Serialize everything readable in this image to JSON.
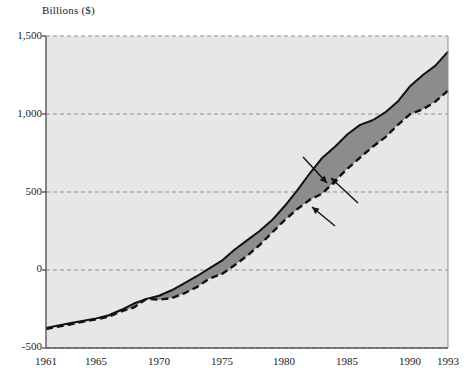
{
  "figure": {
    "axis_label_top": "Billions ($)",
    "plot_bg_color": "#e7e7e7",
    "band_color": "#8c8c8c",
    "line_color": "#111111",
    "grid_color": "#8f8f8f",
    "axis_color": "#555555"
  },
  "annotations": {
    "expenditures": "Expenditures",
    "deficit": "Deficit",
    "receipts": "Receipts"
  },
  "yticks": {
    "t0": "1,500",
    "t1": "1,000",
    "t2": "500",
    "t3": "0",
    "t4": "-500"
  },
  "xticks": {
    "t0": "1961",
    "t1": "1965",
    "t2": "1970",
    "t3": "1975",
    "t4": "1980",
    "t5": "1985",
    "t6": "1990",
    "t7": "1993"
  },
  "chart_data": {
    "type": "area",
    "title": "",
    "xlabel": "",
    "ylabel": "Billions ($)",
    "xlim": [
      1961,
      1993
    ],
    "ylim": [
      -500,
      1500
    ],
    "ytick_values": [
      -500,
      0,
      500,
      1000,
      1500
    ],
    "xtick_values": [
      1961,
      1965,
      1970,
      1975,
      1980,
      1985,
      1990,
      1993
    ],
    "grid": "horizontal-dashed",
    "legend": "none (inline annotations with arrows)",
    "annotations": [
      {
        "text": "Expenditures",
        "points_to_series": "Expenditures",
        "near_year": 1983
      },
      {
        "text": "Deficit",
        "points_to_series": "shaded band between curves",
        "near_year": 1985
      },
      {
        "text": "Receipts",
        "points_to_series": "Receipts",
        "near_year": 1981
      }
    ],
    "x": [
      1961,
      1962,
      1963,
      1964,
      1965,
      1966,
      1967,
      1968,
      1969,
      1970,
      1971,
      1972,
      1973,
      1974,
      1975,
      1976,
      1977,
      1978,
      1979,
      1980,
      1981,
      1982,
      1983,
      1984,
      1985,
      1986,
      1987,
      1988,
      1989,
      1990,
      1991,
      1992,
      1993
    ],
    "series": [
      {
        "name": "Expenditures",
        "style": "solid-upper-boundary-of-shaded-band",
        "values": [
          -372,
          -355,
          -340,
          -325,
          -310,
          -290,
          -255,
          -215,
          -185,
          -165,
          -130,
          -85,
          -40,
          10,
          60,
          130,
          190,
          250,
          320,
          410,
          510,
          620,
          720,
          790,
          870,
          930,
          960,
          1010,
          1080,
          1180,
          1250,
          1310,
          1400
        ]
      },
      {
        "name": "Receipts",
        "style": "dashed-lower-boundary-of-shaded-band",
        "values": [
          -378,
          -362,
          -348,
          -330,
          -316,
          -300,
          -265,
          -240,
          -185,
          -190,
          -180,
          -150,
          -110,
          -55,
          -25,
          30,
          90,
          160,
          240,
          320,
          390,
          450,
          490,
          570,
          650,
          720,
          790,
          850,
          930,
          1000,
          1030,
          1080,
          1150
        ]
      },
      {
        "name": "Deficit",
        "style": "shaded-area-between-Expenditures-and-Receipts",
        "values": [
          6,
          7,
          8,
          5,
          6,
          10,
          10,
          25,
          0,
          25,
          50,
          65,
          70,
          65,
          85,
          100,
          100,
          90,
          80,
          90,
          120,
          170,
          230,
          220,
          220,
          210,
          170,
          160,
          150,
          180,
          220,
          230,
          250
        ]
      }
    ]
  }
}
